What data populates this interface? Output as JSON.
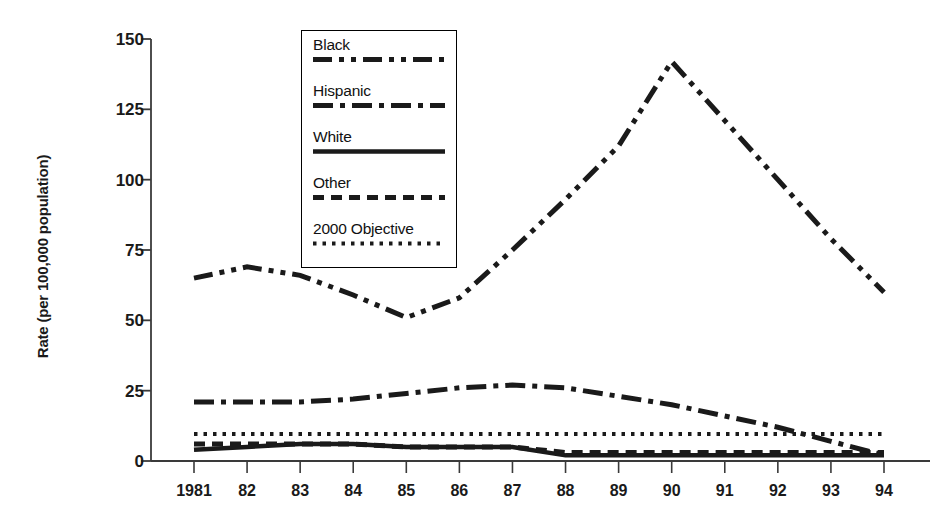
{
  "chart_data": {
    "type": "line",
    "title": "",
    "xlabel": "",
    "ylabel": "Rate (per 100,000 population)",
    "x": [
      1981,
      1982,
      1983,
      1984,
      1985,
      1986,
      1987,
      1988,
      1989,
      1990,
      1991,
      1992,
      1993,
      1994
    ],
    "xtick_labels": [
      "1981",
      "82",
      "83",
      "84",
      "85",
      "86",
      "87",
      "88",
      "89",
      "90",
      "91",
      "92",
      "93",
      "94"
    ],
    "ytick_labels": [
      "0",
      "25",
      "50",
      "75",
      "100",
      "125",
      "150"
    ],
    "yticks": [
      0,
      25,
      50,
      75,
      100,
      125,
      150
    ],
    "ylim": [
      0,
      150
    ],
    "grid": false,
    "legend_position": "upper-left-inset",
    "series": [
      {
        "name": "Black",
        "style": "long-dash-dot-dot",
        "color": "#1a1a1a",
        "values": [
          65,
          69,
          66,
          59,
          51,
          58,
          75,
          93,
          112,
          142,
          121,
          100,
          79,
          60
        ]
      },
      {
        "name": "Hispanic",
        "style": "long-dash-dot",
        "color": "#1a1a1a",
        "values": [
          21,
          21,
          21,
          22,
          24,
          26,
          27,
          26,
          23,
          20,
          16,
          12,
          7,
          2
        ]
      },
      {
        "name": "White",
        "style": "solid",
        "color": "#1a1a1a",
        "values": [
          4,
          5,
          6,
          6,
          5,
          5,
          5,
          2,
          2,
          2,
          2,
          2,
          2,
          2
        ]
      },
      {
        "name": "Other",
        "style": "dashed",
        "color": "#1a1a1a",
        "values": [
          6,
          6,
          6,
          6,
          5,
          5,
          5,
          3,
          3,
          3,
          3,
          3,
          3,
          3
        ]
      },
      {
        "name": "2000 Objective",
        "style": "dotted",
        "color": "#1a1a1a",
        "values": [
          9.6,
          9.6,
          9.6,
          9.6,
          9.6,
          9.6,
          9.6,
          9.6,
          9.6,
          9.6,
          9.6,
          9.6,
          9.6,
          9.6
        ]
      }
    ]
  },
  "axes": {
    "y_axis_title": "Rate (per 100,000 population)"
  },
  "legend": {
    "entries": [
      {
        "label": "Black"
      },
      {
        "label": "Hispanic"
      },
      {
        "label": "White"
      },
      {
        "label": "Other"
      },
      {
        "label": "2000 Objective"
      }
    ]
  }
}
